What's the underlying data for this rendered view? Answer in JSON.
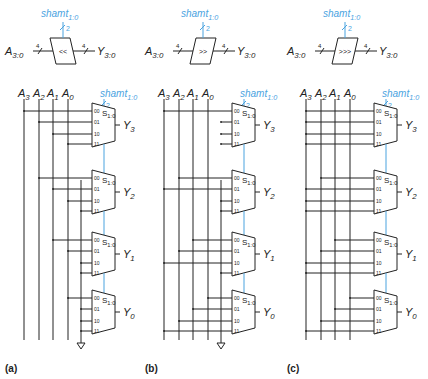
{
  "colors": {
    "wire": "#222222",
    "accent": "#4aa3df",
    "background": "#ffffff"
  },
  "panels": [
    {
      "id": "a",
      "caption": "(a)",
      "offset_x": 0,
      "symbol": {
        "input": "A",
        "input_sub": "3:0",
        "output": "Y",
        "output_sub": "3:0",
        "op": "<<",
        "bus_width": "4",
        "shamt": "shamt",
        "shamt_sub": "1:0",
        "shamt_width": "2"
      },
      "inputs": [
        {
          "name": "A",
          "sub": "3"
        },
        {
          "name": "A",
          "sub": "2"
        },
        {
          "name": "A",
          "sub": "1"
        },
        {
          "name": "A",
          "sub": "0"
        }
      ],
      "has_ground": true,
      "muxes": [
        {
          "output": "Y",
          "output_sub": "3",
          "select": "S",
          "select_sub": "1:0",
          "sources": [
            "A3",
            "A2",
            "A1",
            "A0"
          ]
        },
        {
          "output": "Y",
          "output_sub": "2",
          "select": "S",
          "select_sub": "1:0",
          "sources": [
            "A2",
            "A1",
            "A0",
            "0"
          ]
        },
        {
          "output": "Y",
          "output_sub": "1",
          "select": "S",
          "select_sub": "1:0",
          "sources": [
            "A1",
            "A0",
            "0",
            "0"
          ]
        },
        {
          "output": "Y",
          "output_sub": "0",
          "select": "S",
          "select_sub": "1:0",
          "sources": [
            "A0",
            "0",
            "0",
            "0"
          ]
        }
      ]
    },
    {
      "id": "b",
      "caption": "(b)",
      "offset_x": 140,
      "symbol": {
        "input": "A",
        "input_sub": "3:0",
        "output": "Y",
        "output_sub": "3:0",
        "op": ">>",
        "bus_width": "4",
        "shamt": "shamt",
        "shamt_sub": "1:0",
        "shamt_width": "2"
      },
      "inputs": [
        {
          "name": "A",
          "sub": "3"
        },
        {
          "name": "A",
          "sub": "2"
        },
        {
          "name": "A",
          "sub": "1"
        },
        {
          "name": "A",
          "sub": "0"
        }
      ],
      "has_ground": true,
      "muxes": [
        {
          "output": "Y",
          "output_sub": "3",
          "select": "S",
          "select_sub": "1:0",
          "sources": [
            "A3",
            "0",
            "0",
            "0"
          ]
        },
        {
          "output": "Y",
          "output_sub": "2",
          "select": "S",
          "select_sub": "1:0",
          "sources": [
            "A2",
            "A3",
            "0",
            "0"
          ]
        },
        {
          "output": "Y",
          "output_sub": "1",
          "select": "S",
          "select_sub": "1:0",
          "sources": [
            "A1",
            "A2",
            "A3",
            "0"
          ]
        },
        {
          "output": "Y",
          "output_sub": "0",
          "select": "S",
          "select_sub": "1:0",
          "sources": [
            "A0",
            "A1",
            "A2",
            "A3"
          ]
        }
      ]
    },
    {
      "id": "c",
      "caption": "(c)",
      "offset_x": 282,
      "symbol": {
        "input": "A",
        "input_sub": "3:0",
        "output": "Y",
        "output_sub": "3:0",
        "op": ">>>",
        "bus_width": "4",
        "shamt": "shamt",
        "shamt_sub": "1:0",
        "shamt_width": "2"
      },
      "inputs": [
        {
          "name": "A",
          "sub": "3"
        },
        {
          "name": "A",
          "sub": "2"
        },
        {
          "name": "A",
          "sub": "1"
        },
        {
          "name": "A",
          "sub": "0"
        }
      ],
      "has_ground": false,
      "muxes": [
        {
          "output": "Y",
          "output_sub": "3",
          "select": "S",
          "select_sub": "1:0",
          "sources": [
            "A3",
            "A3",
            "A3",
            "A3"
          ]
        },
        {
          "output": "Y",
          "output_sub": "2",
          "select": "S",
          "select_sub": "1:0",
          "sources": [
            "A2",
            "A3",
            "A3",
            "A3"
          ]
        },
        {
          "output": "Y",
          "output_sub": "1",
          "select": "S",
          "select_sub": "1:0",
          "sources": [
            "A1",
            "A2",
            "A3",
            "A3"
          ]
        },
        {
          "output": "Y",
          "output_sub": "0",
          "select": "S",
          "select_sub": "1:0",
          "sources": [
            "A0",
            "A1",
            "A2",
            "A3"
          ]
        }
      ]
    }
  ],
  "mux_pin_labels": [
    "00",
    "01",
    "10",
    "11"
  ]
}
